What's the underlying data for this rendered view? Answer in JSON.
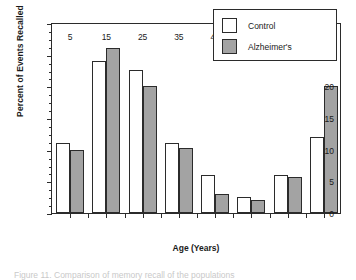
{
  "figure": {
    "background": "#ffffff",
    "axis_color": "#2b2b2b",
    "caption_partial": "Figure 11. Comparison of memory recall of the populations"
  },
  "chart_data": {
    "type": "bar",
    "title": "",
    "xlabel": "Age (Years)",
    "ylabel": "Percent of Events Recalled",
    "categories": [
      "5",
      "15",
      "25",
      "35",
      "45",
      "55",
      "65",
      "75"
    ],
    "series": [
      {
        "name": "Control",
        "color": "#ffffff",
        "values": [
          11,
          24,
          22.6,
          11,
          6,
          2.5,
          6,
          12
        ]
      },
      {
        "name": "Alzheimer's",
        "color": "#a3a3a3",
        "values": [
          10,
          26,
          20,
          10.2,
          3,
          2,
          5.7,
          20
        ]
      }
    ],
    "ylim": [
      0,
      30
    ],
    "yticks": [
      0,
      5,
      10,
      15,
      20,
      25,
      30
    ],
    "ytick_labels": [
      "0",
      "5",
      "10",
      "15",
      "20",
      "25",
      "30"
    ],
    "yminor_step": 1.25,
    "grid": false,
    "legend_position": "top-right"
  }
}
